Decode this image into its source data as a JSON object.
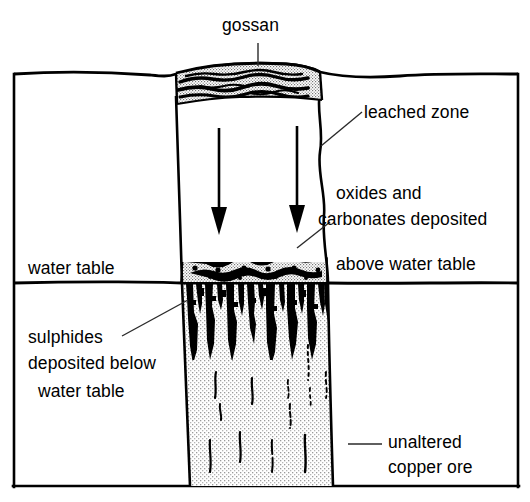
{
  "diagram": {
    "title": "gossan",
    "type": "geological-cross-section",
    "labels": {
      "gossan": "gossan",
      "leached_zone": "leached zone",
      "oxides_line1": "oxides and",
      "oxides_line2": "carbonates deposited",
      "oxides_line3": "above water table",
      "water_table": "water table",
      "sulphides_line1": "sulphides",
      "sulphides_line2": "deposited below",
      "sulphides_line3": "water table",
      "unaltered_line1": "unaltered",
      "unaltered_line2": "copper ore"
    },
    "colors": {
      "ink": "#000000",
      "background": "#ffffff",
      "stipple_light": "#e8e8e8",
      "stipple_mid": "#d8d8d8",
      "leader": "#555555"
    },
    "zones": [
      {
        "name": "gossan",
        "label": "gossan",
        "position": "cap at ground surface"
      },
      {
        "name": "leached-zone",
        "label": "leached zone",
        "position": "below gossan, above oxide zone"
      },
      {
        "name": "oxide-carbonate-zone",
        "label": "oxides and carbonates deposited above water table",
        "position": "immediately above water table"
      },
      {
        "name": "sulphide-zone",
        "label": "sulphides deposited below water table",
        "position": "immediately below water table"
      },
      {
        "name": "unaltered-ore",
        "label": "unaltered copper ore",
        "position": "lowest, primary ore"
      }
    ],
    "arrows": {
      "count": 2,
      "direction": "down",
      "meaning": "downward percolation of groundwater through leached zone"
    }
  }
}
